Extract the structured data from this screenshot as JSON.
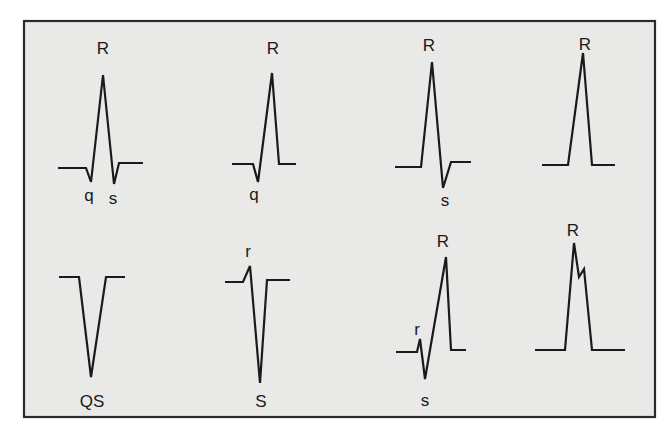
{
  "figure": {
    "background": "#e9e9e7",
    "border_color": "#2b2b2b",
    "line_color": "#1a1a1a"
  },
  "complexes": [
    {
      "id": "qRs",
      "points": "58,168 86,168 91,182 103,75 114,184 119,163 143,163",
      "labels": [
        {
          "text": "R",
          "x": 103,
          "y": 54
        },
        {
          "text": "q",
          "x": 89,
          "y": 201
        },
        {
          "text": "s",
          "x": 113,
          "y": 204
        }
      ]
    },
    {
      "id": "qR",
      "points": "232,164 253,164 258,182 272,73 279,164 296,164",
      "labels": [
        {
          "text": "R",
          "x": 273,
          "y": 54
        },
        {
          "text": "q",
          "x": 254,
          "y": 200
        }
      ]
    },
    {
      "id": "Rs",
      "points": "395,167 421,167 432,62 443,188 451,162 471,162",
      "labels": [
        {
          "text": "R",
          "x": 429,
          "y": 51
        },
        {
          "text": "s",
          "x": 445,
          "y": 206
        }
      ]
    },
    {
      "id": "R",
      "points": "542,165 568,165 583,53 592,165 615,165",
      "labels": [
        {
          "text": "R",
          "x": 585,
          "y": 50
        }
      ]
    },
    {
      "id": "QS",
      "points": "59,277 79,277 91,377 106,277 125,277",
      "labels": [
        {
          "text": "QS",
          "x": 92,
          "y": 407
        }
      ]
    },
    {
      "id": "rS",
      "points": "225,282 243,282 250,266 260,383 267,280 290,280",
      "labels": [
        {
          "text": "r",
          "x": 248,
          "y": 257
        },
        {
          "text": "S",
          "x": 261,
          "y": 407
        }
      ]
    },
    {
      "id": "rsR",
      "points": "396,352 417,352 420,339 425,379 446,257 451,350 466,350",
      "labels": [
        {
          "text": "r",
          "x": 417,
          "y": 335
        },
        {
          "text": "s",
          "x": 425,
          "y": 406
        },
        {
          "text": "R",
          "x": 443,
          "y": 247
        }
      ]
    },
    {
      "id": "notched-R",
      "points": "535,350 565,350 574,243 579,277 584,269 592,350 625,350",
      "labels": [
        {
          "text": "R",
          "x": 573,
          "y": 236
        }
      ]
    }
  ]
}
